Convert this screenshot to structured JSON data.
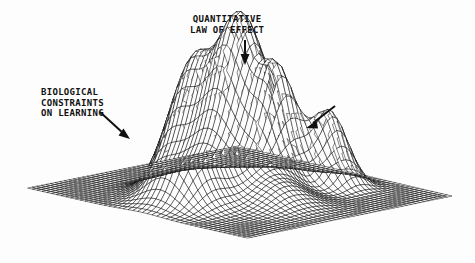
{
  "figure": {
    "kind": "3d-wireframe-surface-plot",
    "style": "scanned monochrome line drawing",
    "background_color": "#fdfdfd",
    "line_color": "#111111"
  },
  "annotations": [
    {
      "id": "quantitative",
      "text": "QUANTITATIVE\nLAW OF EFFECT",
      "arrow_icon": "arrow-down-icon",
      "points_to_peak": "central"
    },
    {
      "id": "biological",
      "text": "BIOLOGICAL\nCONSTRAINTS\nON LEARNING",
      "arrow_icon": "arrow-down-right-icon",
      "points_to_peak": "left-small"
    },
    {
      "id": "schedule",
      "text": "SCHEDULE\nEFFECTS",
      "arrow_icon": "arrow-down-left-icon",
      "points_to_peak": "right-upper"
    }
  ],
  "chart_data": {
    "type": "surface",
    "title": "",
    "xlabel": "",
    "ylabel": "",
    "zlabel": "",
    "grid": true,
    "legend": "none",
    "projection": {
      "corner_left": [
        28,
        188
      ],
      "corner_top": [
        238,
        146
      ],
      "corner_right": [
        452,
        196
      ],
      "corner_front": [
        248,
        238
      ]
    },
    "grid_resolution": [
      46,
      46
    ],
    "xlim": [
      0,
      1
    ],
    "ylim": [
      0,
      1
    ],
    "zlim": [
      0,
      1
    ],
    "peaks": [
      {
        "name": "left-small",
        "x": 0.2,
        "y": 0.52,
        "amplitude": 0.37,
        "sigma_x": 0.075,
        "sigma_y": 0.085,
        "label": "BIOLOGICAL CONSTRAINTS ON LEARNING"
      },
      {
        "name": "left-medium",
        "x": 0.34,
        "y": 0.44,
        "amplitude": 0.72,
        "sigma_x": 0.082,
        "sigma_y": 0.09,
        "label": ""
      },
      {
        "name": "central",
        "x": 0.54,
        "y": 0.46,
        "amplitude": 1.0,
        "sigma_x": 0.09,
        "sigma_y": 0.1,
        "label": "QUANTITATIVE LAW OF EFFECT"
      },
      {
        "name": "right-upper",
        "x": 0.72,
        "y": 0.46,
        "amplitude": 0.54,
        "sigma_x": 0.058,
        "sigma_y": 0.066,
        "label": "SCHEDULE EFFECTS"
      },
      {
        "name": "right-lower",
        "x": 0.8,
        "y": 0.62,
        "amplitude": 0.43,
        "sigma_x": 0.058,
        "sigma_y": 0.066,
        "label": ""
      },
      {
        "name": "front-bump",
        "x": 0.44,
        "y": 0.72,
        "amplitude": 0.13,
        "sigma_x": 0.095,
        "sigma_y": 0.09,
        "label": ""
      }
    ]
  }
}
